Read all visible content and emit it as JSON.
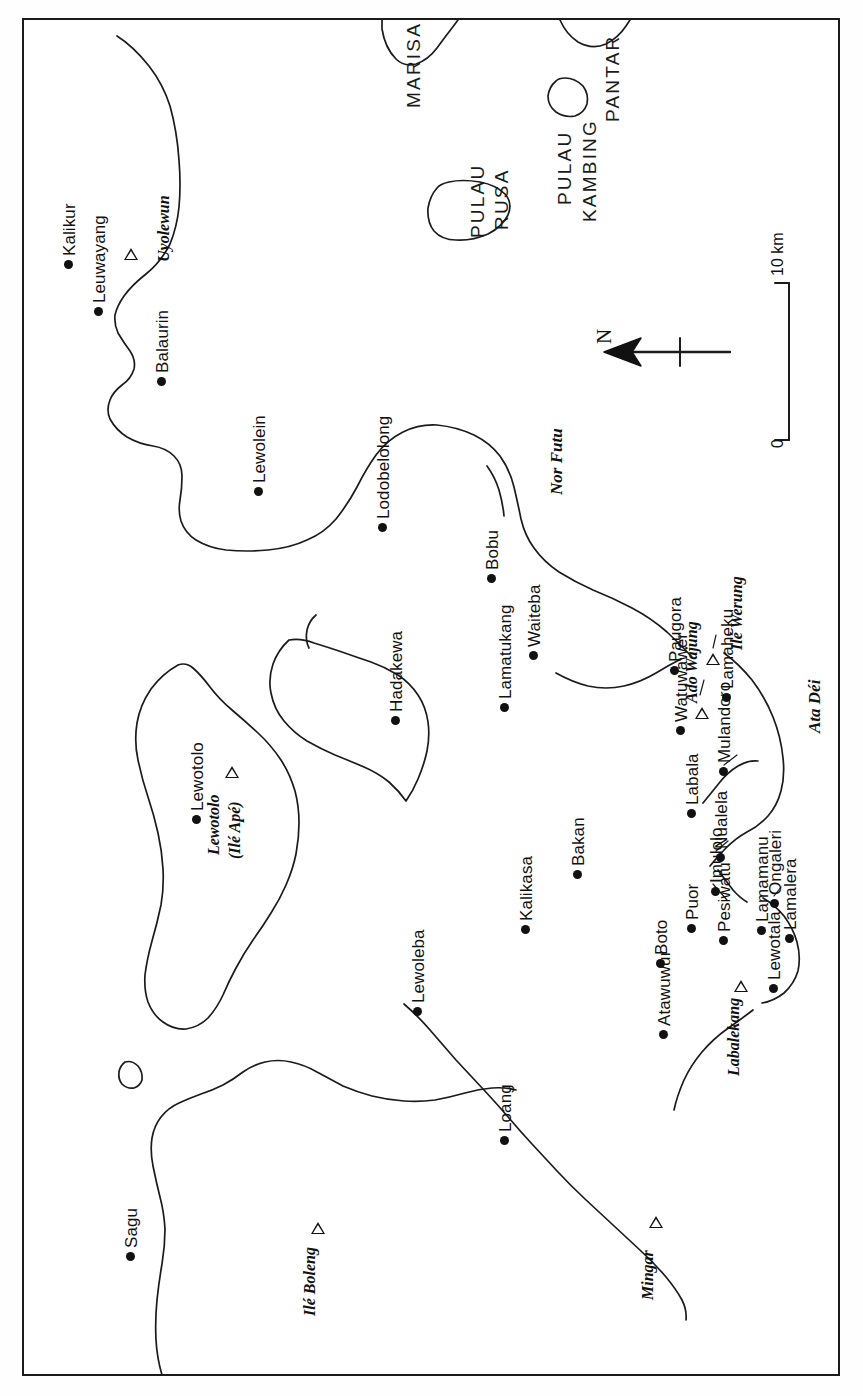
{
  "map": {
    "title": "Lembata (Lomblen) Island and surrounding islands",
    "orientation_note": "All map lettering is rotated 90 degrees (reads bottom-to-top)",
    "north_arrow": {
      "label": "N",
      "points": "left"
    },
    "scale_bar": {
      "min_label": "0",
      "max_label": "10 km",
      "unit": "km",
      "length_km": 10
    },
    "frame": {
      "style": "single thin neat-line rectangle",
      "color": "#1b1b1b"
    },
    "background_color": "#ffffff",
    "ink_color": "#111111",
    "settlements": [
      {
        "name": "Kalikur",
        "x": 68,
        "y": 264
      },
      {
        "name": "Leuwayang",
        "x": 98,
        "y": 311
      },
      {
        "name": "Balaurin",
        "x": 161,
        "y": 381
      },
      {
        "name": "Lewolein",
        "x": 258,
        "y": 491
      },
      {
        "name": "Lodobelolong",
        "x": 382,
        "y": 527
      },
      {
        "name": "Bobu",
        "x": 491,
        "y": 578
      },
      {
        "name": "Waiteba",
        "x": 533,
        "y": 655
      },
      {
        "name": "Paugora",
        "x": 674,
        "y": 670
      },
      {
        "name": "Hadakewa",
        "x": 395,
        "y": 720
      },
      {
        "name": "Lamatukang",
        "x": 504,
        "y": 707
      },
      {
        "name": "Watuwawer",
        "x": 680,
        "y": 730
      },
      {
        "name": "Lamaheku",
        "x": 726,
        "y": 697
      },
      {
        "name": "Lewotolo",
        "x": 196,
        "y": 819
      },
      {
        "name": "Mulandoro",
        "x": 723,
        "y": 771
      },
      {
        "name": "Labala",
        "x": 691,
        "y": 813
      },
      {
        "name": "Bakan",
        "x": 577,
        "y": 874
      },
      {
        "name": "Nualela",
        "x": 720,
        "y": 857
      },
      {
        "name": "Ongaleri",
        "x": 774,
        "y": 903
      },
      {
        "name": "Kalikasa",
        "x": 525,
        "y": 929
      },
      {
        "name": "Imulolo",
        "x": 715,
        "y": 891
      },
      {
        "name": "Lamamanu",
        "x": 761,
        "y": 930
      },
      {
        "name": "Lewoleba",
        "x": 417,
        "y": 1011
      },
      {
        "name": "Boto",
        "x": 660,
        "y": 963
      },
      {
        "name": "Puor",
        "x": 691,
        "y": 928
      },
      {
        "name": "Pesiwatu",
        "x": 723,
        "y": 940
      },
      {
        "name": "Lamalera",
        "x": 789,
        "y": 938
      },
      {
        "name": "Lewotala",
        "x": 773,
        "y": 988
      },
      {
        "name": "Atawuwur",
        "x": 663,
        "y": 1034
      },
      {
        "name": "Loang",
        "x": 504,
        "y": 1140
      },
      {
        "name": "Sagu",
        "x": 130,
        "y": 1256
      }
    ],
    "volcanoes": [
      {
        "name": "Uyolewun",
        "sub": "",
        "peak_x": 131,
        "peak_y": 254,
        "lab_x": 156,
        "lab_y": 262,
        "lab_rot": true
      },
      {
        "name": "Lewotolo",
        "sub": "(Ilé Apé)",
        "peak_x": 232,
        "peak_y": 772,
        "lab_x": 206,
        "lab_y": 855,
        "lab_rot": true
      },
      {
        "name": "Ado Wajung",
        "sub": "",
        "peak_x": 702,
        "peak_y": 713,
        "lab_x": 684,
        "lab_y": 703,
        "lab_rot": true
      },
      {
        "name": "Ilé Werung",
        "sub": "",
        "peak_x": 713,
        "peak_y": 659,
        "lab_x": 729,
        "lab_y": 650,
        "lab_rot": true
      },
      {
        "name": "Labalekang",
        "sub": "",
        "peak_x": 741,
        "peak_y": 986,
        "lab_x": 726,
        "lab_y": 1076,
        "lab_rot": true
      },
      {
        "name": "Mingar",
        "sub": "",
        "peak_x": 656,
        "peak_y": 1222,
        "lab_x": 640,
        "lab_y": 1300,
        "lab_rot": true
      },
      {
        "name": "Ilé Boleng",
        "sub": "",
        "peak_x": 318,
        "peak_y": 1228,
        "lab_x": 302,
        "lab_y": 1316,
        "lab_rot": true
      }
    ],
    "region_labels": [
      {
        "name": "MARISA",
        "x": 404,
        "y": 108,
        "style": "bigcaps"
      },
      {
        "name": "PANTAR",
        "x": 603,
        "y": 122,
        "style": "bigcaps"
      },
      {
        "name": "PULAU",
        "x": 468,
        "y": 238,
        "style": "bigcaps"
      },
      {
        "name": "RUSA",
        "x": 492,
        "y": 230,
        "style": "bigcaps"
      },
      {
        "name": "PULAU",
        "x": 555,
        "y": 205,
        "style": "bigcaps"
      },
      {
        "name": "KAMBING",
        "x": 580,
        "y": 222,
        "style": "bigcaps"
      },
      {
        "name": "Nor Futu",
        "x": 548,
        "y": 495,
        "style": "region-italic"
      },
      {
        "name": "Ata Déi",
        "x": 806,
        "y": 733,
        "style": "region-italic"
      }
    ],
    "water_bodies": [
      "Nor Futu",
      "Labala Bay"
    ],
    "islands": [
      "Lembata (Lomblen)",
      "Adonara",
      "Pulau Rusa",
      "Pulau Kambing",
      "Pantar",
      "Marisa"
    ]
  }
}
